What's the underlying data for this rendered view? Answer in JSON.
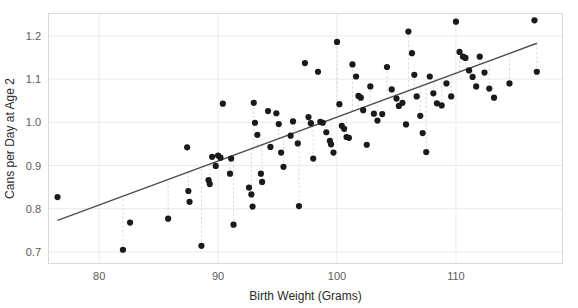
{
  "figure": {
    "width": 578,
    "height": 308,
    "background": "#ffffff",
    "panel": {
      "left": 48,
      "top": 13,
      "right": 563,
      "bottom": 264
    }
  },
  "style": {
    "point_color": "#1a1a1a",
    "line_color": "#4f4f4f",
    "grid_color": "#ebebeb",
    "residual_color": "#d8d8d8",
    "border_color": "#d9d9d9",
    "tick_label_color": "#5b5b5b",
    "axis_title_color": "#2b2b2b",
    "point_radius": 3.1,
    "line_width": 1.4
  },
  "chart_data": {
    "type": "scatter",
    "title": "",
    "subtitle": "",
    "xlabel": "Birth Weight (Grams)",
    "ylabel": "Cans per Day at Age 2",
    "xlim": [
      75.7,
      119.0
    ],
    "ylim": [
      0.672,
      1.253
    ],
    "xticks": [
      80,
      90,
      100,
      110
    ],
    "xtick_labels": [
      "80",
      "90",
      "100",
      "110"
    ],
    "yticks": [
      0.7,
      0.8,
      0.9,
      1.0,
      1.1,
      1.2
    ],
    "ytick_labels": [
      "0.7",
      "0.8",
      "0.9",
      "1.0",
      "1.1",
      "1.2"
    ],
    "grid": true,
    "grid_axis": "both",
    "legend": null,
    "legend_position": "none",
    "annotations": [],
    "series": [
      {
        "name": "observations",
        "type": "scatter",
        "marker": "circle",
        "color": "#1a1a1a",
        "points": [
          [
            76.5,
            0.827
          ],
          [
            82.0,
            0.705
          ],
          [
            82.6,
            0.768
          ],
          [
            85.8,
            0.777
          ],
          [
            87.4,
            0.942
          ],
          [
            87.5,
            0.841
          ],
          [
            87.6,
            0.816
          ],
          [
            88.6,
            0.714
          ],
          [
            89.2,
            0.866
          ],
          [
            89.3,
            0.857
          ],
          [
            89.5,
            0.92
          ],
          [
            89.8,
            0.899
          ],
          [
            90.0,
            0.923
          ],
          [
            90.2,
            0.918
          ],
          [
            90.4,
            1.043
          ],
          [
            91.0,
            0.881
          ],
          [
            91.1,
            0.916
          ],
          [
            91.3,
            0.763
          ],
          [
            92.6,
            0.849
          ],
          [
            92.8,
            0.833
          ],
          [
            92.9,
            0.805
          ],
          [
            93.0,
            1.045
          ],
          [
            93.1,
            0.999
          ],
          [
            93.3,
            0.971
          ],
          [
            93.6,
            0.881
          ],
          [
            93.7,
            0.862
          ],
          [
            94.2,
            1.026
          ],
          [
            94.4,
            0.943
          ],
          [
            94.9,
            1.021
          ],
          [
            95.1,
            0.996
          ],
          [
            95.3,
            0.93
          ],
          [
            95.5,
            0.897
          ],
          [
            96.1,
            0.969
          ],
          [
            96.3,
            1.002
          ],
          [
            96.7,
            0.951
          ],
          [
            96.8,
            0.806
          ],
          [
            97.3,
            1.137
          ],
          [
            97.6,
            1.012
          ],
          [
            97.8,
            0.998
          ],
          [
            98.0,
            0.916
          ],
          [
            98.4,
            1.117
          ],
          [
            98.6,
            1.001
          ],
          [
            98.8,
            0.999
          ],
          [
            99.1,
            0.977
          ],
          [
            99.4,
            0.957
          ],
          [
            99.5,
            0.949
          ],
          [
            99.7,
            0.93
          ],
          [
            100.0,
            1.186
          ],
          [
            100.2,
            1.042
          ],
          [
            100.4,
            0.992
          ],
          [
            100.6,
            0.985
          ],
          [
            100.8,
            0.966
          ],
          [
            101.0,
            0.964
          ],
          [
            101.3,
            1.134
          ],
          [
            101.6,
            1.106
          ],
          [
            101.8,
            1.061
          ],
          [
            102.0,
            1.057
          ],
          [
            102.2,
            1.028
          ],
          [
            102.5,
            0.948
          ],
          [
            102.8,
            1.083
          ],
          [
            103.1,
            1.02
          ],
          [
            103.4,
            1.004
          ],
          [
            103.8,
            1.019
          ],
          [
            104.2,
            1.128
          ],
          [
            104.6,
            1.076
          ],
          [
            105.0,
            1.055
          ],
          [
            105.2,
            1.038
          ],
          [
            105.5,
            1.045
          ],
          [
            105.8,
            0.995
          ],
          [
            106.0,
            1.21
          ],
          [
            106.3,
            1.16
          ],
          [
            106.5,
            1.11
          ],
          [
            106.7,
            1.06
          ],
          [
            107.0,
            1.015
          ],
          [
            107.2,
            0.975
          ],
          [
            107.5,
            0.931
          ],
          [
            107.8,
            1.106
          ],
          [
            108.1,
            1.067
          ],
          [
            108.4,
            1.044
          ],
          [
            108.8,
            1.039
          ],
          [
            109.2,
            1.09
          ],
          [
            109.6,
            1.06
          ],
          [
            110.0,
            1.233
          ],
          [
            110.3,
            1.163
          ],
          [
            110.6,
            1.152
          ],
          [
            110.8,
            1.149
          ],
          [
            111.1,
            1.12
          ],
          [
            111.4,
            1.105
          ],
          [
            111.7,
            1.083
          ],
          [
            112.0,
            1.152
          ],
          [
            112.4,
            1.115
          ],
          [
            112.8,
            1.078
          ],
          [
            113.2,
            1.057
          ],
          [
            114.5,
            1.09
          ],
          [
            116.6,
            1.236
          ],
          [
            116.8,
            1.117
          ]
        ]
      },
      {
        "name": "regression-line",
        "type": "line",
        "color": "#4f4f4f",
        "x_start": 76.5,
        "y_start": 0.773,
        "x_end": 116.8,
        "y_end": 1.183
      }
    ],
    "residual_lines": {
      "visible": true,
      "style": "dashed",
      "color": "#d8d8d8",
      "description": "vertical dashed segments connecting selected points to the fitted line"
    }
  }
}
